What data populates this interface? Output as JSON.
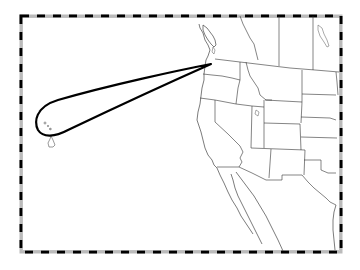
{
  "map": {
    "title": "",
    "region": "Western United States and Pacific",
    "frame": {
      "x": 21,
      "y": 16,
      "width": 320,
      "height": 236,
      "style": "alternating black/white neatline"
    },
    "route": {
      "description": "Loop route from Pacific Northwest to Hawaiian Islands and back",
      "origin": "Seattle, WA",
      "destination": "Hawaiian Islands",
      "color": "#000000"
    },
    "features": [
      "Washington",
      "Oregon",
      "California",
      "Idaho",
      "Nevada",
      "Montana",
      "Wyoming",
      "Utah",
      "Arizona",
      "Colorado",
      "New Mexico",
      "North Dakota",
      "South Dakota",
      "Nebraska",
      "Kansas",
      "Oklahoma",
      "Texas",
      "Baja California",
      "Mexico",
      "British Columbia",
      "Vancouver Island",
      "Lake Winnipeg",
      "Great Salt Lake",
      "Hawaiian Islands"
    ],
    "colors": {
      "background": "#ffffff",
      "lines": "#333333",
      "route": "#000000"
    }
  }
}
